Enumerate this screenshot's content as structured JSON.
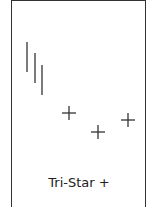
{
  "diagram": {
    "title": "Tri-Star +",
    "pattern": "Tri-Star bullish",
    "stroke_color": "#333333",
    "candles": [
      {
        "type": "line",
        "x": 27,
        "y1": 42,
        "y2": 72
      },
      {
        "type": "line",
        "x": 35,
        "y1": 53,
        "y2": 83
      },
      {
        "type": "line",
        "x": 42,
        "y1": 65,
        "y2": 95
      },
      {
        "type": "doji",
        "cx": 69,
        "cy": 113,
        "half_w": 7,
        "half_h": 7
      },
      {
        "type": "doji",
        "cx": 98,
        "cy": 132,
        "half_w": 7,
        "half_h": 7
      },
      {
        "type": "doji",
        "cx": 128,
        "cy": 120,
        "half_w": 7,
        "half_h": 7
      }
    ]
  }
}
